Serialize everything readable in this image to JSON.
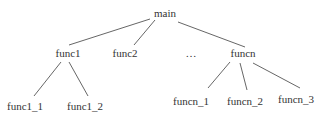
{
  "diagram": {
    "type": "tree",
    "root": "main",
    "line_color": "#555555",
    "text_color": "#333333",
    "nodes": {
      "main": {
        "label": "main",
        "x": 165,
        "y": 7
      },
      "func1": {
        "label": "func1",
        "x": 68,
        "y": 47
      },
      "func2": {
        "label": "func2",
        "x": 125,
        "y": 47
      },
      "ellipsis": {
        "label": "…",
        "x": 191,
        "y": 47
      },
      "funcn": {
        "label": "funcn",
        "x": 243,
        "y": 47
      },
      "func1_1": {
        "label": "func1_1",
        "x": 25,
        "y": 100
      },
      "func1_2": {
        "label": "func1_2",
        "x": 85,
        "y": 100
      },
      "funcn_1": {
        "label": "funcn_1",
        "x": 191,
        "y": 95
      },
      "funcn_2": {
        "label": "funcn_2",
        "x": 245,
        "y": 95
      },
      "funcn_3": {
        "label": "funcn_3",
        "x": 296,
        "y": 93
      }
    },
    "edges": [
      {
        "from": "main",
        "to": "func1",
        "x1": 150,
        "y1": 19,
        "x2": 69,
        "y2": 45
      },
      {
        "from": "main",
        "to": "func2",
        "x1": 155,
        "y1": 20,
        "x2": 134,
        "y2": 45
      },
      {
        "from": "main",
        "to": "funcn",
        "x1": 178,
        "y1": 22,
        "x2": 245,
        "y2": 47
      },
      {
        "from": "func1",
        "to": "func1_1",
        "x1": 61,
        "y1": 62,
        "x2": 34,
        "y2": 96
      },
      {
        "from": "func1",
        "to": "func1_2",
        "x1": 69,
        "y1": 62,
        "x2": 88,
        "y2": 96
      },
      {
        "from": "funcn",
        "to": "funcn_1",
        "x1": 230,
        "y1": 62,
        "x2": 208,
        "y2": 88
      },
      {
        "from": "funcn",
        "to": "funcn_2",
        "x1": 240,
        "y1": 63,
        "x2": 247,
        "y2": 90
      },
      {
        "from": "funcn",
        "to": "funcn_3",
        "x1": 253,
        "y1": 63,
        "x2": 300,
        "y2": 88
      }
    ]
  }
}
